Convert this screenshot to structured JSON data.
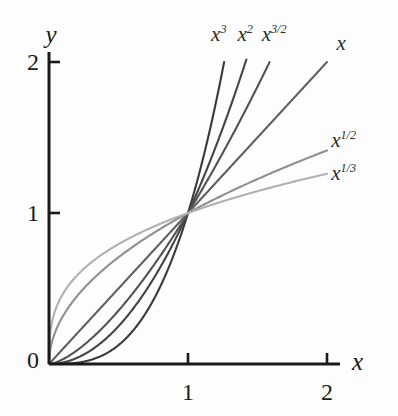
{
  "figure": {
    "background_color": "#fdfdfd",
    "axis_color": "#1a1a1a"
  },
  "axes": {
    "x_axis_name": "x",
    "y_axis_name": "y",
    "origin_label": "0",
    "x_ticks": [
      {
        "value": 1,
        "label": "1"
      },
      {
        "value": 2,
        "label": "2"
      }
    ],
    "y_ticks": [
      {
        "value": 1,
        "label": "1"
      },
      {
        "value": 2,
        "label": "2"
      }
    ]
  },
  "chart_data": {
    "type": "line",
    "title": "",
    "xlabel": "x",
    "ylabel": "y",
    "xlim": [
      0,
      2.2
    ],
    "ylim": [
      0,
      2.15
    ],
    "grid": false,
    "legend_position": "inline-curve-end-labels",
    "annotations": [
      "All curves pass through the point (1, 1)",
      "All curves pass through the origin (0, 0)"
    ],
    "series": [
      {
        "name": "x^3",
        "label": "x",
        "exponent_label": "3",
        "exponent": 3,
        "color": "#3a3a3a",
        "label_x": 1.22,
        "label_y": 2.18,
        "x": [
          0,
          0.1,
          0.2,
          0.3,
          0.4,
          0.5,
          0.6,
          0.7,
          0.8,
          0.9,
          1.0,
          1.05,
          1.1,
          1.15,
          1.2,
          1.25,
          1.26
        ],
        "y": [
          0,
          0.001,
          0.008,
          0.027,
          0.064,
          0.125,
          0.216,
          0.343,
          0.512,
          0.729,
          1.0,
          1.158,
          1.331,
          1.521,
          1.728,
          1.953,
          2.0
        ]
      },
      {
        "name": "x^2",
        "label": "x",
        "exponent_label": "2",
        "exponent": 2,
        "color": "#444444",
        "label_x": 1.41,
        "label_y": 2.18,
        "x": [
          0,
          0.1,
          0.2,
          0.3,
          0.4,
          0.5,
          0.6,
          0.7,
          0.8,
          0.9,
          1.0,
          1.1,
          1.2,
          1.3,
          1.4,
          1.42
        ],
        "y": [
          0,
          0.01,
          0.04,
          0.09,
          0.16,
          0.25,
          0.36,
          0.49,
          0.64,
          0.81,
          1.0,
          1.21,
          1.44,
          1.69,
          1.96,
          2.0
        ]
      },
      {
        "name": "x^(3/2)",
        "label": "x",
        "exponent_label": "3/2",
        "exponent": 1.5,
        "color": "#535353",
        "label_x": 1.62,
        "label_y": 2.18,
        "x": [
          0,
          0.1,
          0.2,
          0.3,
          0.4,
          0.5,
          0.6,
          0.7,
          0.8,
          0.9,
          1.0,
          1.1,
          1.2,
          1.3,
          1.4,
          1.5,
          1.587
        ],
        "y": [
          0,
          0.032,
          0.089,
          0.164,
          0.253,
          0.354,
          0.465,
          0.586,
          0.716,
          0.854,
          1.0,
          1.154,
          1.315,
          1.482,
          1.657,
          1.837,
          2.0
        ]
      },
      {
        "name": "x",
        "label": "x",
        "exponent_label": "",
        "exponent": 1,
        "color": "#5f5f5f",
        "label_x": 2.1,
        "label_y": 2.12,
        "x": [
          0,
          0.25,
          0.5,
          0.75,
          1.0,
          1.25,
          1.5,
          1.75,
          2.0
        ],
        "y": [
          0,
          0.25,
          0.5,
          0.75,
          1.0,
          1.25,
          1.5,
          1.75,
          2.0
        ]
      },
      {
        "name": "x^(1/2)",
        "label": "x",
        "exponent_label": "1/2",
        "exponent": 0.5,
        "color": "#8f8f8f",
        "label_x": 2.12,
        "label_y": 1.48,
        "x": [
          0,
          0.02,
          0.05,
          0.1,
          0.2,
          0.3,
          0.4,
          0.5,
          0.6,
          0.7,
          0.8,
          0.9,
          1.0,
          1.2,
          1.4,
          1.6,
          1.8,
          2.0
        ],
        "y": [
          0,
          0.141,
          0.224,
          0.316,
          0.447,
          0.548,
          0.632,
          0.707,
          0.775,
          0.837,
          0.894,
          0.949,
          1.0,
          1.095,
          1.183,
          1.265,
          1.342,
          1.414
        ]
      },
      {
        "name": "x^(1/3)",
        "label": "x",
        "exponent_label": "1/3",
        "exponent": 0.3333,
        "color": "#b0b0b0",
        "label_x": 2.12,
        "label_y": 1.26,
        "x": [
          0,
          0.01,
          0.02,
          0.05,
          0.1,
          0.2,
          0.3,
          0.4,
          0.5,
          0.6,
          0.7,
          0.8,
          0.9,
          1.0,
          1.2,
          1.4,
          1.6,
          1.8,
          2.0
        ],
        "y": [
          0,
          0.215,
          0.271,
          0.368,
          0.464,
          0.585,
          0.669,
          0.737,
          0.794,
          0.843,
          0.888,
          0.928,
          0.965,
          1.0,
          1.063,
          1.119,
          1.17,
          1.216,
          1.26
        ]
      }
    ]
  }
}
